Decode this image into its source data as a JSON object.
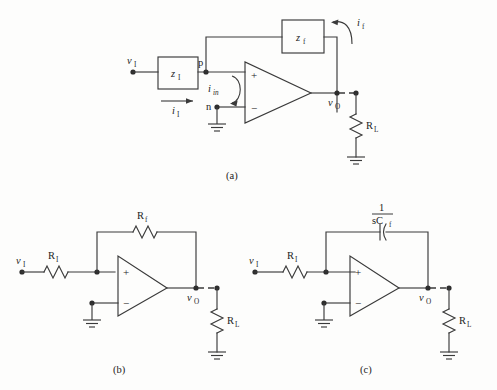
{
  "figure": {
    "type": "circuit-schematic-figure",
    "panel_count": 3,
    "captions": {
      "a": "(a)",
      "b": "(b)",
      "c": "(c)"
    }
  },
  "panel_a": {
    "caption": "(a)",
    "description": "Generalized op-amp feedback network with impedance blocks",
    "input_source_label": "v",
    "input_source_sub": "I",
    "input_block_label": "z",
    "input_block_sub": "I",
    "input_current_label": "i",
    "input_current_sub": "I",
    "node_p_label": "p",
    "node_n_label": "n",
    "input_current_in_label": "i",
    "input_current_in_sub": "in",
    "feedback_block_label": "z",
    "feedback_block_sub": "f",
    "feedback_current_label": "i",
    "feedback_current_sub": "f",
    "opamp_plus": "+",
    "opamp_minus": "−",
    "output_label": "v",
    "output_sub": "O",
    "load_label": "R",
    "load_sub": "L"
  },
  "panel_b": {
    "caption": "(b)",
    "description": "Non-inverting resistive feedback amplifier",
    "input_source_label": "v",
    "input_source_sub": "I",
    "input_resistor_label": "R",
    "input_resistor_sub": "I",
    "feedback_resistor_label": "R",
    "feedback_resistor_sub": "f",
    "opamp_plus": "+",
    "opamp_minus": "−",
    "output_label": "v",
    "output_sub": "O",
    "load_label": "R",
    "load_sub": "L"
  },
  "panel_c": {
    "caption": "(c)",
    "description": "Capacitive feedback amplifier with impedance 1/sCf",
    "input_source_label": "v",
    "input_source_sub": "I",
    "input_resistor_label": "R",
    "input_resistor_sub": "I",
    "feedback_numerator": "1",
    "feedback_denominator": "sC",
    "feedback_denominator_sub": "f",
    "opamp_plus": "+",
    "opamp_minus": "−",
    "output_label": "v",
    "output_sub": "O",
    "load_label": "R",
    "load_sub": "L"
  },
  "colors": {
    "background": "#fdfdfc",
    "line": "#3a3a3a",
    "text": "#232323",
    "node": "#2d2d2d"
  }
}
